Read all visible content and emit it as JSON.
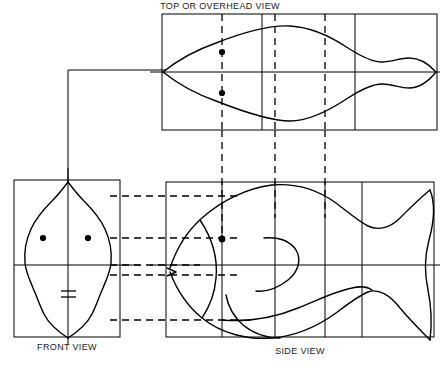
{
  "drawing": {
    "title_visible": false,
    "type": "orthographic-projection",
    "subject": "fish",
    "line_color": "#000000",
    "background_color": "#ffffff",
    "labels": {
      "top": "TOP OR OVERHEAD VIEW",
      "front": "FRONT VIEW",
      "side": "SIDE VIEW"
    },
    "views": {
      "top": {
        "name": "top-or-overhead-view",
        "box": {
          "x": 162,
          "y": 14,
          "w": 275,
          "h": 116
        },
        "centerline_y": 72,
        "solid_dividers_x": [
          262,
          355
        ],
        "dashed_construction_x": [
          222,
          275,
          325
        ],
        "eyes": [
          {
            "cx": 222,
            "cy": 52,
            "r": 3.1
          },
          {
            "cx": 222,
            "cy": 93,
            "r": 3.1
          }
        ]
      },
      "front": {
        "name": "front-view",
        "box": {
          "x": 14,
          "y": 180,
          "w": 106,
          "h": 157
        },
        "centerline_x": 68,
        "centerline_y": 265,
        "eyes": [
          {
            "cx": 43,
            "cy": 238,
            "r": 3.1
          },
          {
            "cx": 88,
            "cy": 238,
            "r": 3.1
          }
        ],
        "mouth_lines_y": [
          292,
          298
        ]
      },
      "side": {
        "name": "side-view",
        "box": {
          "x": 166,
          "y": 182,
          "w": 268,
          "h": 155
        },
        "centerline_y": 265,
        "solid_dividers_x": [
          222,
          275,
          325,
          362
        ],
        "eye": {
          "cx": 222,
          "cy": 239,
          "r": 3.4
        }
      }
    },
    "projection_lines": {
      "miter": {
        "from_x": 68,
        "corner_x": 68,
        "corner_y": 70,
        "to_x": 166
      },
      "horizontal_dashed_y": [
        196,
        238,
        265,
        275,
        320
      ],
      "horizontal_dashed_x_start": 110,
      "horizontal_dashed_x_end": 240,
      "vertical_dashed_x": [
        222,
        275,
        325
      ],
      "vertical_dashed_y_start": 14,
      "vertical_dashed_y_end": 240
    }
  }
}
